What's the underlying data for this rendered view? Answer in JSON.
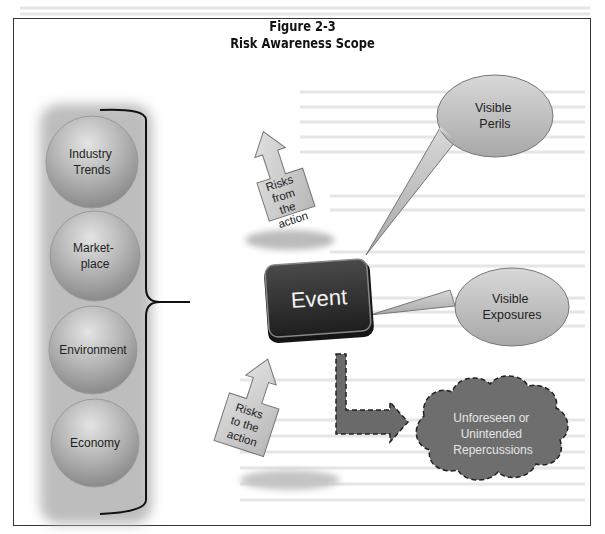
{
  "figure": {
    "number": "Figure 2-3",
    "title": "Risk Awareness Scope"
  },
  "factors": [
    {
      "label_lines": [
        "Industry",
        "Trends"
      ]
    },
    {
      "label_lines": [
        "Market-",
        "place"
      ]
    },
    {
      "label_lines": [
        "Environment"
      ]
    },
    {
      "label_lines": [
        "Economy"
      ]
    }
  ],
  "event": {
    "label": "Event"
  },
  "arrows": {
    "from_action": {
      "label_lines": [
        "Risks",
        "from",
        "the",
        "action"
      ]
    },
    "to_action": {
      "label_lines": [
        "Risks",
        "to the",
        "action"
      ]
    }
  },
  "callouts": [
    {
      "label_lines": [
        "Visible",
        "Perils"
      ]
    },
    {
      "label_lines": [
        "Visible",
        "Exposures"
      ]
    }
  ],
  "cloud": {
    "label_lines": [
      "Unforeseen or",
      "Unintended",
      "Repercussions"
    ]
  },
  "colors": {
    "sphere": "#a9a9a9",
    "event_box": "#2e2e2e",
    "arrow_fill": "#c8c8c8",
    "callout_fill": "#bdbdbd",
    "cloud_fill": "#6e6e6e",
    "l_arrow_fill": "#6a6a6a"
  }
}
